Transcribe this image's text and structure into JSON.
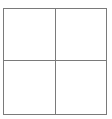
{
  "icon": {
    "name": "grid-2x2-icon",
    "rows": 2,
    "columns": 2,
    "line_color": "#7a7a7a",
    "background": "#ffffff"
  }
}
